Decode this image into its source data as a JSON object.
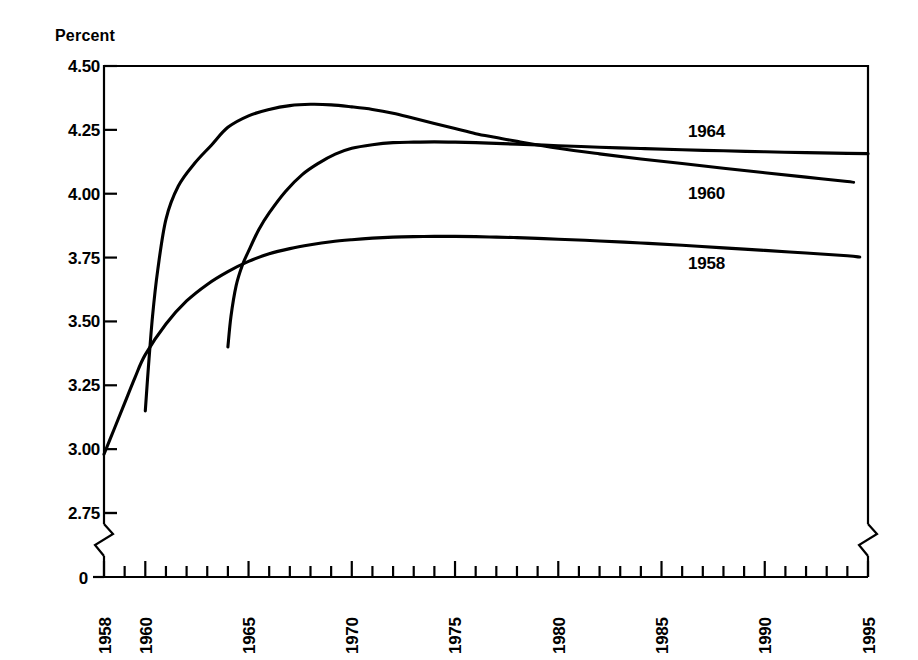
{
  "chart_data": {
    "type": "line",
    "title": "",
    "ylabel": "Percent",
    "xlabel": "",
    "ylim": [
      2.6875,
      4.5
    ],
    "xlim": [
      1958,
      1995
    ],
    "grid": false,
    "legend_position": "inline-right-of-curves",
    "y_ticks": [
      "4.50",
      "4.25",
      "4.00",
      "3.75",
      "3.50",
      "3.25",
      "3.00",
      "2.75",
      "0"
    ],
    "y_tick_values": [
      4.5,
      4.25,
      4.0,
      3.75,
      3.5,
      3.25,
      3.0,
      2.75,
      0
    ],
    "y_axis_break": true,
    "x_ticks": [
      "1958",
      "1960",
      "1965",
      "1970",
      "1975",
      "1980",
      "1985",
      "1990",
      "1995"
    ],
    "x_tick_values": [
      1958,
      1960,
      1965,
      1970,
      1975,
      1980,
      1985,
      1990,
      1995
    ],
    "x_minor_tick_interval": 1,
    "line_color": "#000000",
    "series": [
      {
        "name": "1958",
        "label": "1958",
        "x": [
          1958,
          1958.5,
          1959,
          1959.5,
          1960,
          1961,
          1962,
          1963,
          1964,
          1965,
          1966,
          1967,
          1968,
          1969,
          1970,
          1971,
          1972,
          1973,
          1974,
          1975,
          1976,
          1977,
          1978,
          1979,
          1980,
          1982,
          1984,
          1986,
          1988,
          1990,
          1992,
          1994,
          1994.6
        ],
        "y": [
          2.98,
          3.08,
          3.18,
          3.28,
          3.37,
          3.49,
          3.58,
          3.645,
          3.695,
          3.735,
          3.765,
          3.785,
          3.8,
          3.812,
          3.82,
          3.826,
          3.83,
          3.832,
          3.833,
          3.833,
          3.832,
          3.83,
          3.828,
          3.825,
          3.822,
          3.815,
          3.807,
          3.798,
          3.788,
          3.778,
          3.768,
          3.757,
          3.752
        ]
      },
      {
        "name": "1960",
        "label": "1960",
        "x": [
          1960,
          1960.15,
          1960.35,
          1960.6,
          1961,
          1961.6,
          1962.4,
          1963.2,
          1964,
          1965,
          1966,
          1967,
          1968,
          1969,
          1970,
          1971,
          1972,
          1973,
          1974,
          1975,
          1976,
          1977,
          1978,
          1980,
          1982,
          1984,
          1986,
          1988,
          1990,
          1992,
          1994,
          1994.3
        ],
        "y": [
          3.15,
          3.32,
          3.52,
          3.7,
          3.9,
          4.03,
          4.12,
          4.19,
          4.26,
          4.305,
          4.33,
          4.345,
          4.35,
          4.348,
          4.34,
          4.33,
          4.315,
          4.295,
          4.275,
          4.255,
          4.235,
          4.22,
          4.205,
          4.178,
          4.156,
          4.136,
          4.118,
          4.1,
          4.082,
          4.065,
          4.048,
          4.045
        ]
      },
      {
        "name": "1964",
        "label": "1964",
        "x": [
          1964,
          1964.15,
          1964.4,
          1964.7,
          1965,
          1965.5,
          1966,
          1966.8,
          1967.6,
          1968.4,
          1969.2,
          1970,
          1971,
          1972,
          1973,
          1974,
          1975,
          1976,
          1977,
          1978,
          1980,
          1982,
          1984,
          1986,
          1988,
          1990,
          1992,
          1994,
          1995
        ],
        "y": [
          3.4,
          3.52,
          3.64,
          3.72,
          3.775,
          3.86,
          3.925,
          4.01,
          4.075,
          4.12,
          4.155,
          4.178,
          4.192,
          4.2,
          4.202,
          4.203,
          4.202,
          4.2,
          4.197,
          4.194,
          4.188,
          4.182,
          4.177,
          4.172,
          4.168,
          4.164,
          4.161,
          4.158,
          4.157
        ]
      }
    ]
  },
  "series_labels": {
    "s1964": "1964",
    "s1960": "1960",
    "s1958": "1958"
  },
  "axis": {
    "y_title": "Percent",
    "zero_label": "0"
  }
}
